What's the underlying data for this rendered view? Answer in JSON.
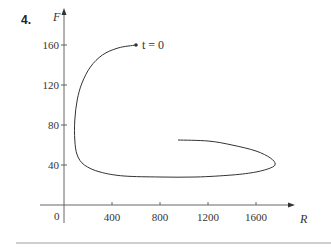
{
  "problem": {
    "number": "4."
  },
  "chart_data": {
    "type": "line",
    "title": "",
    "xlabel": "R",
    "ylabel": "F",
    "xlim": [
      -150,
      2000
    ],
    "ylim": [
      -20,
      180
    ],
    "grid": false,
    "legend": null,
    "x_ticks": [
      400,
      800,
      1200,
      1600
    ],
    "x_tick_labels": [
      "400",
      "800",
      "1200",
      "1600"
    ],
    "y_ticks": [
      40,
      80,
      120,
      160
    ],
    "y_tick_labels": [
      "40",
      "80",
      "120",
      "160"
    ],
    "origin_label": "0",
    "annotations": [
      {
        "text": "t = 0",
        "x": 600,
        "y": 160
      }
    ],
    "series": [
      {
        "name": "phase trajectory (R, F)",
        "parametric": true,
        "start_marker": true,
        "points": [
          [
            600,
            160
          ],
          [
            450,
            157
          ],
          [
            320,
            150
          ],
          [
            220,
            138
          ],
          [
            150,
            122
          ],
          [
            110,
            105
          ],
          [
            90,
            85
          ],
          [
            90,
            65
          ],
          [
            110,
            50
          ],
          [
            170,
            40
          ],
          [
            300,
            33
          ],
          [
            500,
            29
          ],
          [
            800,
            28
          ],
          [
            1100,
            28
          ],
          [
            1400,
            30
          ],
          [
            1600,
            33
          ],
          [
            1720,
            37
          ],
          [
            1760,
            41
          ],
          [
            1720,
            47
          ],
          [
            1600,
            54
          ],
          [
            1400,
            60
          ],
          [
            1200,
            64
          ],
          [
            950,
            65
          ]
        ]
      }
    ]
  },
  "colors": {
    "curve": "#333333",
    "axis": "#555555",
    "rule": "#888888"
  }
}
